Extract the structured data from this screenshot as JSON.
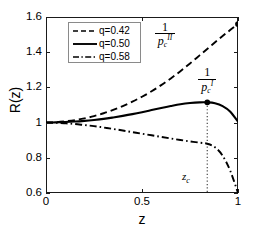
{
  "chart_data": {
    "type": "line",
    "title": "",
    "xlabel": "z",
    "ylabel": "R(z)",
    "xlim": [
      0,
      1
    ],
    "ylim": [
      0.6,
      1.6
    ],
    "xticks": [
      "0",
      "0.5",
      "1"
    ],
    "xtick_values": [
      0,
      0.5,
      1
    ],
    "yticks": [
      "0.6",
      "0.8",
      "1",
      "1.2",
      "1.4",
      "1.6"
    ],
    "ytick_values": [
      0.6,
      0.8,
      1.0,
      1.2,
      1.4,
      1.6
    ],
    "grid": false,
    "legend_position": "upper left",
    "series": [
      {
        "name": "q=0.42",
        "style": "dashed",
        "color": "#000000",
        "x": [
          0.0,
          0.05,
          0.1,
          0.15,
          0.2,
          0.25,
          0.3,
          0.35,
          0.4,
          0.45,
          0.5,
          0.55,
          0.6,
          0.65,
          0.7,
          0.75,
          0.8,
          0.85,
          0.9,
          0.95,
          1.0
        ],
        "y": [
          1.0,
          1.002,
          1.007,
          1.014,
          1.024,
          1.037,
          1.053,
          1.072,
          1.094,
          1.119,
          1.147,
          1.178,
          1.213,
          1.251,
          1.292,
          1.336,
          1.382,
          1.428,
          1.474,
          1.518,
          1.56
        ]
      },
      {
        "name": "q=0.50",
        "style": "solid",
        "color": "#000000",
        "x": [
          0.0,
          0.05,
          0.1,
          0.15,
          0.2,
          0.25,
          0.3,
          0.35,
          0.4,
          0.45,
          0.5,
          0.55,
          0.6,
          0.65,
          0.7,
          0.75,
          0.8,
          0.84,
          0.88,
          0.92,
          0.96,
          1.0
        ],
        "y": [
          1.0,
          1.001,
          1.003,
          1.006,
          1.01,
          1.015,
          1.021,
          1.029,
          1.038,
          1.048,
          1.059,
          1.071,
          1.083,
          1.094,
          1.104,
          1.111,
          1.115,
          1.115,
          1.11,
          1.094,
          1.062,
          1.005
        ]
      },
      {
        "name": "q=0.58",
        "style": "dashdot",
        "color": "#000000",
        "x": [
          0.0,
          0.05,
          0.1,
          0.15,
          0.2,
          0.25,
          0.3,
          0.35,
          0.4,
          0.45,
          0.5,
          0.55,
          0.6,
          0.65,
          0.7,
          0.75,
          0.8,
          0.84,
          0.88,
          0.92,
          0.96,
          1.0
        ],
        "y": [
          1.0,
          0.999,
          0.996,
          0.992,
          0.986,
          0.98,
          0.972,
          0.964,
          0.955,
          0.946,
          0.937,
          0.928,
          0.919,
          0.91,
          0.901,
          0.893,
          0.886,
          0.88,
          0.86,
          0.812,
          0.725,
          0.6
        ]
      }
    ],
    "markers": [
      {
        "name": "pc-I-peak",
        "x": 0.84,
        "y": 1.115
      },
      {
        "name": "pc-II-end",
        "x": 1.0,
        "y": 1.56
      }
    ],
    "vertical_line": {
      "name": "z_c",
      "x": 0.84,
      "style": "dotted",
      "from": 0.6,
      "to": 1.115
    },
    "annotations": [
      {
        "name": "one-over-pc-II",
        "numerator": "1",
        "den_base": "p",
        "den_sub": "c",
        "den_sup": "II",
        "x": 0.62,
        "y": 1.5
      },
      {
        "name": "one-over-pc-I",
        "numerator": "1",
        "den_base": "p",
        "den_sub": "c",
        "den_sup": "I",
        "x": 0.84,
        "y": 1.24
      },
      {
        "name": "z-critical",
        "text": "z",
        "sub": "c",
        "x": 0.76,
        "y": 0.69
      }
    ]
  },
  "legend": {
    "entries": [
      {
        "label": "q=0.42",
        "style": "dashed"
      },
      {
        "label": "q=0.50",
        "style": "solid"
      },
      {
        "label": "q=0.58",
        "style": "dashdot"
      }
    ]
  }
}
